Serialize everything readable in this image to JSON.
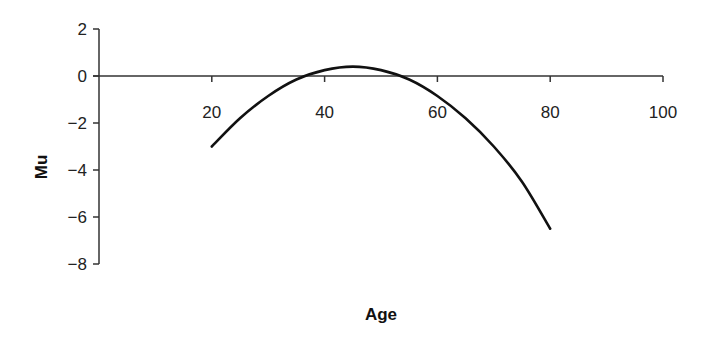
{
  "chart_data": {
    "type": "line",
    "title": "",
    "xlabel": "Age",
    "ylabel": "Mu",
    "xlim": [
      0,
      100
    ],
    "ylim": [
      -8,
      2
    ],
    "x_ticks": [
      20,
      40,
      60,
      80,
      100
    ],
    "y_ticks": [
      2,
      0,
      -2,
      -4,
      -6,
      -8
    ],
    "x_tick_labels": [
      "20",
      "40",
      "60",
      "80",
      "100"
    ],
    "y_tick_labels": [
      "2",
      "0",
      "−2",
      "−4",
      "−6",
      "−8"
    ],
    "grid": false,
    "legend": null,
    "x_axis_at_y": 0,
    "series": [
      {
        "name": "Mu",
        "color": "#111111",
        "x": [
          20,
          25,
          30,
          35,
          40,
          45,
          50,
          55,
          60,
          65,
          70,
          75,
          80
        ],
        "y": [
          -3.0,
          -1.8,
          -0.85,
          -0.15,
          0.25,
          0.4,
          0.25,
          -0.15,
          -0.85,
          -1.8,
          -3.0,
          -4.5,
          -6.5
        ]
      }
    ]
  }
}
